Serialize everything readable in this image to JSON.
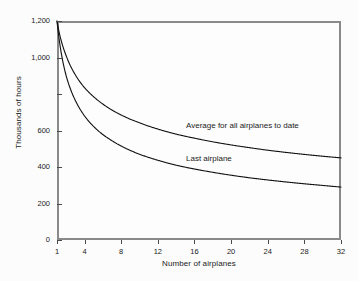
{
  "chart_data": {
    "type": "line",
    "title": "",
    "xlabel": "Number of airplanes",
    "ylabel": "Thousands of hours",
    "xlim": [
      1,
      32
    ],
    "ylim": [
      0,
      1200
    ],
    "grid": false,
    "legend_position": "inline-annotation",
    "xticks": [
      1,
      4,
      8,
      12,
      16,
      20,
      24,
      28,
      32
    ],
    "xtick_labels": [
      "1",
      "4",
      "8",
      "12",
      "16",
      "20",
      "24",
      "28",
      "32"
    ],
    "yticks": [
      0,
      200,
      400,
      600,
      800,
      1000,
      1200
    ],
    "ytick_labels": [
      "0",
      "200",
      "400",
      "600",
      "",
      "1,000",
      "1,200"
    ],
    "x": [
      1,
      2,
      3,
      4,
      5,
      6,
      7,
      8,
      10,
      12,
      14,
      16,
      18,
      20,
      22,
      24,
      26,
      28,
      30,
      32
    ],
    "series": [
      {
        "name": "Average for all airplanes to date",
        "values": [
          1200,
          1010,
          905,
          835,
          785,
          745,
          712,
          685,
          642,
          608,
          580,
          558,
          538,
          521,
          506,
          492,
          480,
          469,
          459,
          450
        ]
      },
      {
        "name": "Last airplane",
        "values": [
          1200,
          900,
          765,
          680,
          622,
          578,
          544,
          515,
          470,
          437,
          410,
          389,
          371,
          355,
          341,
          329,
          318,
          308,
          299,
          290
        ]
      }
    ],
    "annotations": [
      {
        "text": "Average for all airplanes to date",
        "x": 15.1,
        "y": 590
      },
      {
        "text": "Last airplane",
        "x": 15.1,
        "y": 410
      }
    ],
    "colors": {
      "background": "#fcfcfc",
      "plot_background": "#fdfdfd",
      "axis": "#8a8a8a",
      "line": "#111111",
      "text": "#1a1a1a"
    }
  }
}
